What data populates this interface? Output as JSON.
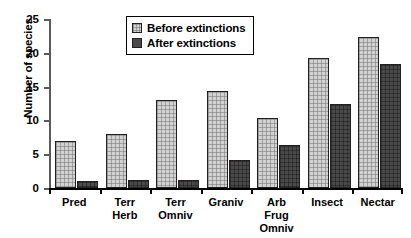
{
  "chart_data": {
    "type": "bar",
    "title": "",
    "xlabel": "",
    "ylabel": "Number of species",
    "ylim": [
      0,
      25
    ],
    "yticks": [
      0,
      5,
      10,
      15,
      20,
      25
    ],
    "grid": false,
    "legend_position": "top-center",
    "categories": [
      "Pred",
      "Terr\nHerb",
      "Terr\nOmniv",
      "Graniv",
      "Arb\nFrug\nOmniv",
      "Insect",
      "Nectar"
    ],
    "series": [
      {
        "name": "Before extinctions",
        "color": "#d2d2d2",
        "values": [
          7,
          8,
          13,
          14.3,
          10.3,
          19.3,
          22.3
        ]
      },
      {
        "name": "After extinctions",
        "color": "#4a4a4a",
        "values": [
          1.1,
          1.2,
          1.2,
          4.2,
          6.3,
          12.4,
          18.4
        ]
      }
    ]
  },
  "legend": {
    "items": [
      {
        "label": "Before extinctions"
      },
      {
        "label": "After extinctions"
      }
    ]
  },
  "axes": {
    "y_title": "Number of species",
    "y_tick_labels": [
      "25",
      "20",
      "15",
      "10",
      "5",
      "0"
    ]
  }
}
